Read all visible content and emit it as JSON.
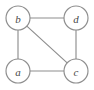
{
  "figure": {
    "background_color": "#ffffff",
    "stroke_color": "#8e8e8e",
    "label_color": "#4a4a4a",
    "width": 94,
    "height": 90
  },
  "graph": {
    "nodes": [
      {
        "id": "b",
        "label": "b",
        "cx": 18,
        "cy": 18,
        "r": 12
      },
      {
        "id": "d",
        "label": "d",
        "cx": 76,
        "cy": 18,
        "r": 12
      },
      {
        "id": "a",
        "label": "a",
        "cx": 18,
        "cy": 71,
        "r": 12
      },
      {
        "id": "c",
        "label": "c",
        "cx": 76,
        "cy": 71,
        "r": 12
      }
    ],
    "edges": [
      {
        "id": "b-d",
        "from": "b",
        "to": "d",
        "x1": 30,
        "y1": 18,
        "x2": 64,
        "y2": 18
      },
      {
        "id": "b-a",
        "from": "b",
        "to": "a",
        "x1": 18,
        "y1": 30,
        "x2": 18,
        "y2": 59
      },
      {
        "id": "d-c",
        "from": "d",
        "to": "c",
        "x1": 76,
        "y1": 30,
        "x2": 76,
        "y2": 59
      },
      {
        "id": "a-c",
        "from": "a",
        "to": "c",
        "x1": 30,
        "y1": 71,
        "x2": 64,
        "y2": 71
      },
      {
        "id": "b-c",
        "from": "b",
        "to": "c",
        "x1": 26.7,
        "y1": 26.2,
        "x2": 67.3,
        "y2": 62.8
      }
    ]
  }
}
